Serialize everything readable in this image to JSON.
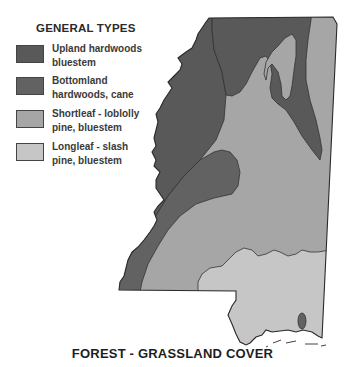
{
  "legend": {
    "title": "GENERAL TYPES",
    "items": [
      {
        "line1": "Upland hardwoods",
        "line2": "bluestem",
        "color": "#595959"
      },
      {
        "line1": "Bottomland",
        "line2": "hardwoods, cane",
        "color": "#626262"
      },
      {
        "line1": "Shortleaf - loblolly",
        "line2": "pine, bluestem",
        "color": "#a6a6a6"
      },
      {
        "line1": "Longleaf - slash",
        "line2": "pine, bluestem",
        "color": "#c6c6c6"
      }
    ]
  },
  "caption": "FOREST - GRASSLAND COVER"
}
